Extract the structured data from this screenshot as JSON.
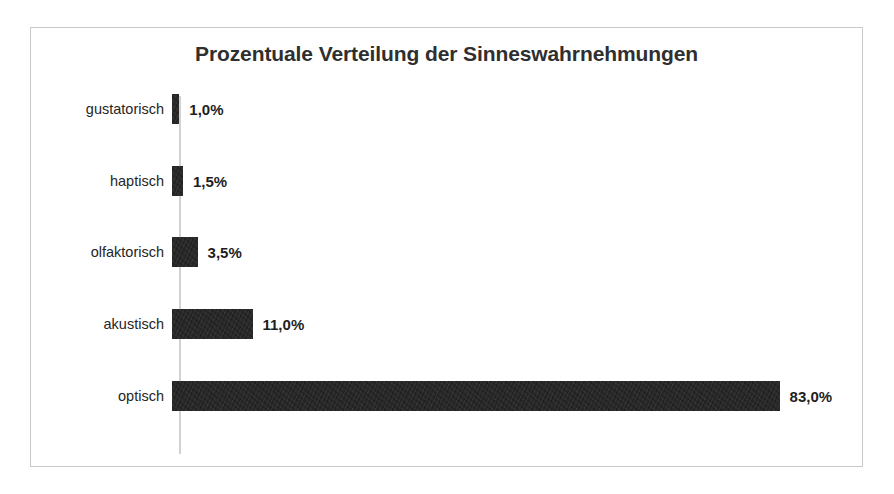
{
  "chart_data": {
    "type": "bar",
    "orientation": "horizontal",
    "title": "Prozentuale Verteilung der Sinneswahrnehmungen",
    "xlabel": "",
    "ylabel": "",
    "categories": [
      "gustatorisch",
      "haptisch",
      "olfaktorisch",
      "akustisch",
      "optisch"
    ],
    "values": [
      1.0,
      1.5,
      3.5,
      11.0,
      83.0
    ],
    "value_labels": [
      "1,0%",
      "1,5%",
      "3,5%",
      "11,0%",
      "83,0%"
    ],
    "unit": "%",
    "xlim": [
      0,
      83
    ],
    "grid": false,
    "legend": false,
    "series": [
      {
        "name": "Anteil",
        "values": [
          1.0,
          1.5,
          3.5,
          11.0,
          83.0
        ]
      }
    ],
    "bar_color": "#1b1b1b",
    "axis_color": "#d2d2d2",
    "frame_color": "#c9c9c9",
    "background_color": "#ffffff",
    "title_color": "#2f2f2f",
    "px_per_percent": 7.32
  },
  "rows": [
    {
      "label": "gustatorisch",
      "value_label": "1,0%",
      "value": 1.0
    },
    {
      "label": "haptisch",
      "value_label": "1,5%",
      "value": 1.5
    },
    {
      "label": "olfaktorisch",
      "value_label": "3,5%",
      "value": 3.5
    },
    {
      "label": "akustisch",
      "value_label": "11,0%",
      "value": 11.0
    },
    {
      "label": "optisch",
      "value_label": "83,0%",
      "value": 83.0
    }
  ]
}
